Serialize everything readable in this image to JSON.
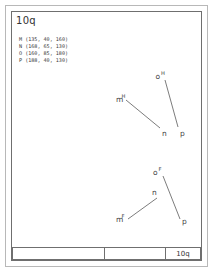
{
  "sheet": {
    "title": "10q"
  },
  "coordinates": {
    "rows": [
      "M (135, 40, 160)",
      "N (168, 65, 130)",
      "O (160, 85, 180)",
      "P (188, 40, 130)"
    ]
  },
  "diagrams": [
    {
      "id": "upper",
      "labels": {
        "m": "m",
        "m_sup": "H",
        "o": "o",
        "o_sup": "H",
        "n": "n",
        "p": "p"
      }
    },
    {
      "id": "lower",
      "labels": {
        "m": "m",
        "m_sup": "F",
        "o": "o",
        "o_sup": "F",
        "n": "n",
        "p": "p"
      }
    }
  ],
  "title_block": {
    "left": "",
    "middle": "",
    "right": "10q"
  },
  "colors": {
    "line": "#5a5a5a",
    "frame": "#6f6f6f",
    "outer_frame": "#b8b8b8",
    "text": "#3a3a3a",
    "background": "#ffffff"
  }
}
